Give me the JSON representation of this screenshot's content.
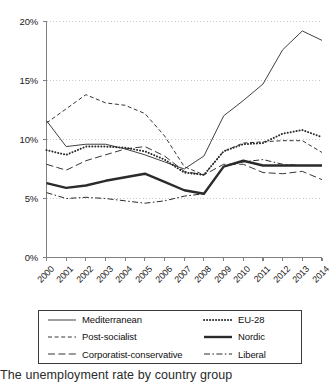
{
  "chart_data": {
    "type": "line",
    "title": "",
    "xlabel": "",
    "ylabel": "",
    "categories": [
      "2000",
      "2001",
      "2002",
      "2003",
      "2004",
      "2005",
      "2006",
      "2007",
      "2008",
      "2009",
      "2010",
      "2011",
      "2012",
      "2013",
      "2014"
    ],
    "ylim": [
      0,
      20
    ],
    "ytick_labels": [
      "0%",
      "5%",
      "10%",
      "15%",
      "20%"
    ],
    "ytick_values": [
      0,
      5,
      10,
      15,
      20
    ],
    "grid": "horizontal-dotted",
    "legend_position": "below-plot",
    "series": [
      {
        "name": "Mediterranean",
        "style": "thin-solid",
        "values": [
          11.6,
          9.4,
          9.6,
          9.6,
          9.2,
          8.7,
          8.1,
          7.5,
          8.6,
          12.0,
          13.3,
          14.7,
          17.6,
          19.2,
          18.4
        ]
      },
      {
        "name": "Post-socialist",
        "style": "short-dash",
        "values": [
          11.4,
          12.6,
          13.8,
          13.1,
          12.9,
          12.2,
          10.3,
          7.7,
          7.0,
          9.0,
          9.7,
          9.8,
          9.9,
          9.9,
          8.9
        ]
      },
      {
        "name": "Corporatist-conservative",
        "style": "long-dash",
        "values": [
          7.9,
          7.4,
          8.2,
          8.7,
          9.2,
          9.4,
          8.6,
          7.3,
          7.0,
          7.9,
          7.9,
          7.2,
          7.1,
          7.3,
          6.6
        ]
      },
      {
        "name": "EU-28",
        "style": "dotted",
        "values": [
          9.1,
          8.7,
          9.4,
          9.4,
          9.3,
          9.0,
          8.3,
          7.2,
          7.0,
          9.0,
          9.6,
          9.7,
          10.5,
          10.8,
          10.2
        ]
      },
      {
        "name": "Nordic",
        "style": "thick-solid",
        "values": [
          6.3,
          5.9,
          6.1,
          6.5,
          6.8,
          7.1,
          6.4,
          5.7,
          5.4,
          7.7,
          8.2,
          7.8,
          7.8,
          7.8,
          7.8
        ]
      },
      {
        "name": "Liberal",
        "style": "dash-dot",
        "values": [
          5.5,
          5.0,
          5.1,
          5.0,
          4.8,
          4.6,
          4.8,
          5.2,
          5.4,
          7.7,
          8.1,
          8.3,
          7.9,
          7.8,
          7.8
        ]
      }
    ]
  },
  "legend": {
    "items": [
      {
        "label": "Mediterranean",
        "style": "thin-solid"
      },
      {
        "label": "Post-socialist",
        "style": "short-dash"
      },
      {
        "label": "Corporatist-conservative",
        "style": "long-dash"
      },
      {
        "label": "EU-28",
        "style": "dotted"
      },
      {
        "label": "Nordic",
        "style": "thick-solid"
      },
      {
        "label": "Liberal",
        "style": "dash-dot"
      }
    ]
  },
  "caption": {
    "text": "The unemployment rate by country group"
  },
  "colors": {
    "line": "#2b2b2b",
    "axis": "#808080",
    "grid": "#c9c9c9",
    "text": "#1a1a1a"
  }
}
